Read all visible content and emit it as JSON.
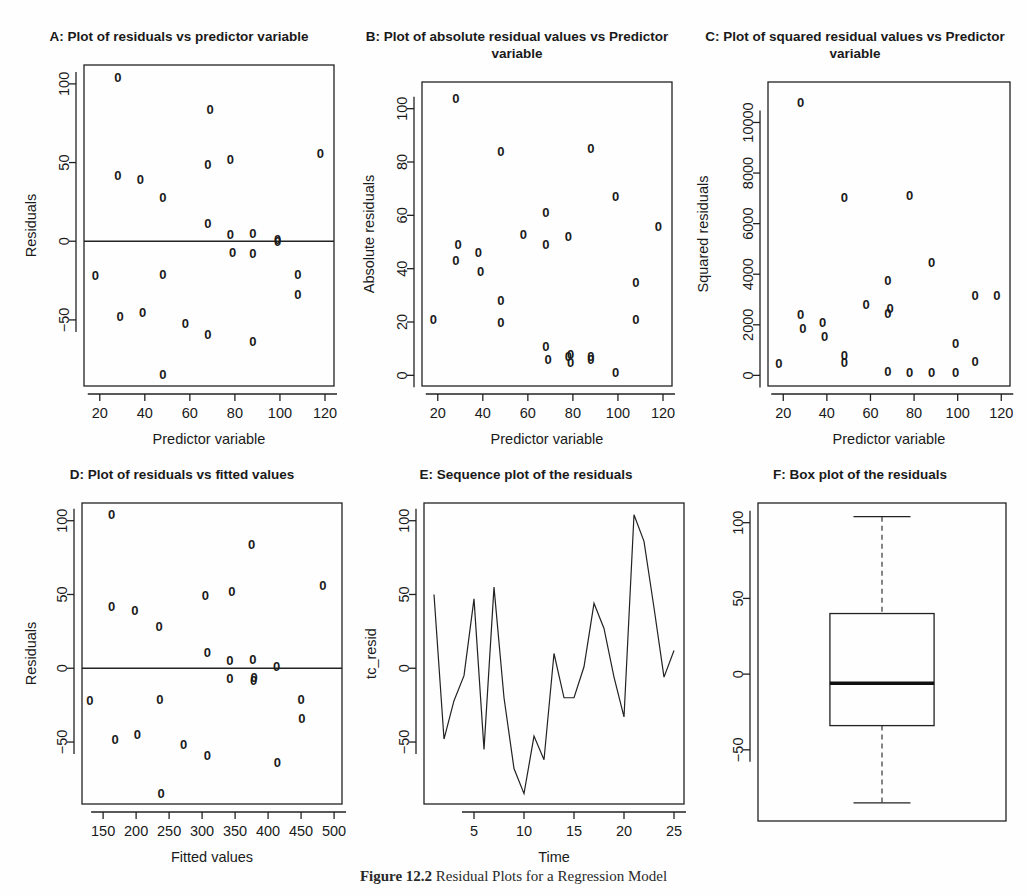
{
  "figure": {
    "caption_label": "Figure 12.2",
    "caption_text": "Residual Plots for a Regression Model",
    "point_glyph": "0"
  },
  "panels": {
    "A": {
      "title": "A: Plot of residuals vs predictor variable",
      "xlabel": "Predictor variable",
      "ylabel": "Residuals",
      "xticks": [
        20,
        40,
        60,
        80,
        100,
        120
      ],
      "yticks": [
        -50,
        0,
        50,
        100
      ],
      "xlim": [
        13,
        124
      ],
      "ylim": [
        -92,
        112
      ],
      "reference_line_y": 0
    },
    "B": {
      "title": "B: Plot of absolute residual values vs Predictor variable",
      "xlabel": "Predictor variable",
      "ylabel": "Absolute residuals",
      "xticks": [
        20,
        40,
        60,
        80,
        100,
        120
      ],
      "yticks": [
        0,
        20,
        40,
        60,
        80,
        100
      ],
      "xlim": [
        13,
        124
      ],
      "ylim": [
        -4,
        110
      ]
    },
    "C": {
      "title": "C: Plot of squared residual values vs Predictor variable",
      "xlabel": "Predictor variable",
      "ylabel": "Squared residuals",
      "xticks": [
        20,
        40,
        60,
        80,
        100,
        120
      ],
      "yticks": [
        0,
        2000,
        4000,
        6000,
        8000,
        10000
      ],
      "xlim": [
        13,
        124
      ],
      "ylim": [
        -420,
        11600
      ]
    },
    "D": {
      "title": "D: Plot of residuals vs fitted values",
      "xlabel": "Fitted values",
      "ylabel": "Residuals",
      "xticks": [
        150,
        200,
        250,
        300,
        350,
        400,
        450,
        500
      ],
      "yticks": [
        -50,
        0,
        50,
        100
      ],
      "xlim": [
        118,
        512
      ],
      "ylim": [
        -92,
        112
      ],
      "reference_line_y": 0
    },
    "E": {
      "title": "E: Sequence plot of the residuals",
      "xlabel": "Time",
      "ylabel": "tc_resid",
      "xticks": [
        5,
        10,
        15,
        20,
        25
      ],
      "yticks": [
        -50,
        0,
        50,
        100
      ],
      "xlim": [
        0,
        26
      ],
      "ylim": [
        -92,
        112
      ]
    },
    "F": {
      "title": "F: Box plot of the residuals",
      "xlabel": "",
      "ylabel": "",
      "yticks": [
        -50,
        0,
        50,
        100
      ],
      "ylim": [
        -97,
        113
      ]
    }
  },
  "chart_data": [
    {
      "type": "scatter",
      "panel": "A",
      "title": "A: Plot of residuals vs predictor variable",
      "xlabel": "Predictor variable",
      "ylabel": "Residuals",
      "xlim": [
        13,
        124
      ],
      "ylim": [
        -92,
        112
      ],
      "grid": false,
      "marker": "0",
      "reference_line_y": 0,
      "x": [
        18,
        28,
        28,
        29,
        38,
        39,
        48,
        48,
        48,
        58,
        68,
        68,
        68,
        69,
        78,
        78,
        79,
        88,
        88,
        88,
        99,
        99,
        108,
        108,
        118
      ],
      "y": [
        -22,
        104,
        42,
        -48,
        39,
        -45,
        28,
        -21,
        -85,
        -52,
        49,
        11,
        -59,
        84,
        52,
        4,
        -7,
        5,
        -8,
        -64,
        1,
        0,
        -21,
        -34,
        56
      ]
    },
    {
      "type": "scatter",
      "panel": "B",
      "title": "B: Plot of absolute residual values vs Predictor variable",
      "xlabel": "Predictor variable",
      "ylabel": "Absolute residuals",
      "xlim": [
        13,
        124
      ],
      "ylim": [
        -4,
        110
      ],
      "grid": false,
      "marker": "0",
      "x": [
        18,
        28,
        28,
        29,
        38,
        39,
        48,
        48,
        48,
        58,
        68,
        68,
        68,
        69,
        78,
        78,
        79,
        79,
        88,
        88,
        88,
        99,
        99,
        108,
        108,
        118
      ],
      "y": [
        21,
        104,
        43,
        49,
        46,
        39,
        84,
        28,
        20,
        53,
        61,
        49,
        11,
        6,
        52,
        7,
        5,
        8,
        85,
        7,
        6,
        67,
        1,
        35,
        21,
        56
      ]
    },
    {
      "type": "scatter",
      "panel": "C",
      "title": "C: Plot of squared residual values vs Predictor variable",
      "xlabel": "Predictor variable",
      "ylabel": "Squared residuals",
      "xlim": [
        13,
        124
      ],
      "ylim": [
        -420,
        11600
      ],
      "grid": false,
      "marker": "0",
      "x": [
        18,
        28,
        28,
        29,
        38,
        39,
        48,
        48,
        48,
        58,
        68,
        68,
        68,
        69,
        78,
        78,
        88,
        88,
        99,
        99,
        108,
        108,
        118
      ],
      "y": [
        450,
        10800,
        2400,
        1850,
        2100,
        1550,
        7050,
        800,
        500,
        2800,
        3750,
        2450,
        150,
        2650,
        100,
        7100,
        100,
        4450,
        100,
        1250,
        550,
        3150,
        3150
      ]
    },
    {
      "type": "scatter",
      "panel": "D",
      "title": "D: Plot of residuals vs fitted values",
      "xlabel": "Fitted values",
      "ylabel": "Residuals",
      "xlim": [
        118,
        512
      ],
      "ylim": [
        -92,
        112
      ],
      "grid": false,
      "marker": "0",
      "reference_line_y": 0,
      "x": [
        130,
        163,
        163,
        168,
        198,
        202,
        235,
        236,
        238,
        272,
        305,
        308,
        308,
        342,
        342,
        345,
        375,
        377,
        378,
        379,
        413,
        414,
        450,
        451,
        483
      ],
      "y": [
        -22,
        104,
        42,
        -48,
        39,
        -45,
        28,
        -21,
        -85,
        -52,
        49,
        11,
        -59,
        5,
        -7,
        52,
        84,
        6,
        -8,
        -6,
        1,
        -64,
        -21,
        -34,
        56
      ]
    },
    {
      "type": "line",
      "panel": "E",
      "title": "E: Sequence plot of the residuals",
      "xlabel": "Time",
      "ylabel": "tc_resid",
      "xlim": [
        0,
        26
      ],
      "ylim": [
        -92,
        112
      ],
      "grid": false,
      "x": [
        1,
        2,
        3,
        4,
        5,
        6,
        7,
        8,
        9,
        10,
        11,
        12,
        13,
        14,
        15,
        16,
        17,
        18,
        19,
        20,
        21,
        22,
        23,
        24,
        25
      ],
      "y": [
        50,
        -48,
        -22,
        -5,
        47,
        -55,
        55,
        -20,
        -68,
        -85,
        -46,
        -62,
        10,
        -20,
        -20,
        1,
        44,
        27,
        -6,
        -33,
        104,
        86,
        41,
        -6,
        12
      ]
    },
    {
      "type": "box",
      "panel": "F",
      "title": "F: Box plot of the residuals",
      "xlabel": "",
      "ylabel": "",
      "ylim": [
        -97,
        113
      ],
      "grid": false,
      "box": {
        "whisker_low": -85,
        "q1": -34,
        "median": -6,
        "q3": 40,
        "whisker_high": 104
      }
    }
  ]
}
